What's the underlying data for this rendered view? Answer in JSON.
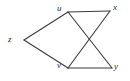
{
  "figure": {
    "type": "graph-diagram",
    "background_color": "#ffffff",
    "edge_color": "#3a3a3a",
    "label_color": "#2b2b2b",
    "width": 130,
    "height": 81
  },
  "vertices": [
    {
      "id": "z",
      "label": "z",
      "x": 24,
      "y": 40,
      "label_x": 8,
      "label_y": 35
    },
    {
      "id": "u",
      "label": "u",
      "x": 68,
      "y": 12,
      "label_x": 57,
      "label_y": 4
    },
    {
      "id": "v",
      "label": "v",
      "x": 68,
      "y": 68,
      "label_x": 57,
      "label_y": 61
    },
    {
      "id": "x",
      "label": "x",
      "x": 110,
      "y": 11,
      "label_x": 113,
      "label_y": 3
    },
    {
      "id": "y",
      "label": "y",
      "x": 112,
      "y": 68,
      "label_x": 114,
      "label_y": 62
    }
  ],
  "edges": [
    {
      "id": "z-u",
      "from": "z",
      "to": "u",
      "x1": 24,
      "y1": 40,
      "x2": 68,
      "y2": 12
    },
    {
      "id": "z-v",
      "from": "z",
      "to": "v",
      "x1": 24,
      "y1": 40,
      "x2": 68,
      "y2": 68
    },
    {
      "id": "u-x",
      "from": "u",
      "to": "x",
      "x1": 68,
      "y1": 12,
      "x2": 110,
      "y2": 11
    },
    {
      "id": "v-y",
      "from": "v",
      "to": "y",
      "x1": 68,
      "y1": 68,
      "x2": 112,
      "y2": 68
    },
    {
      "id": "u-y",
      "from": "u",
      "to": "y",
      "x1": 68,
      "y1": 12,
      "x2": 112,
      "y2": 68
    },
    {
      "id": "v-x",
      "from": "v",
      "to": "x",
      "x1": 68,
      "y1": 68,
      "x2": 110,
      "y2": 11
    }
  ]
}
